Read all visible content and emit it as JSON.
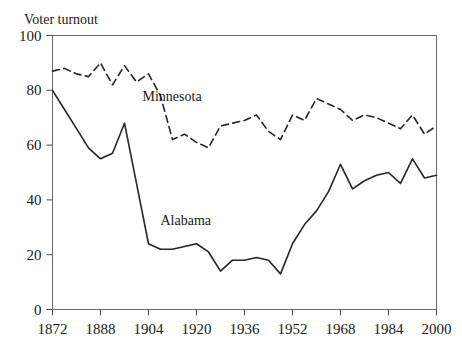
{
  "chart_data": {
    "type": "line",
    "title": "Voter turnout",
    "xlabel": "",
    "ylabel": "Voter turnout",
    "xlim": [
      1872,
      2000
    ],
    "ylim": [
      0,
      100
    ],
    "grid": false,
    "legend_position": "inline-annotation",
    "x_tick_labels": [
      "1872",
      "1888",
      "1904",
      "1920",
      "1936",
      "1952",
      "1968",
      "1984",
      "2000"
    ],
    "x_tick_values": [
      1872,
      1888,
      1904,
      1920,
      1936,
      1952,
      1968,
      1984,
      2000
    ],
    "y_tick_labels": [
      "0",
      "20",
      "40",
      "60",
      "80",
      "100"
    ],
    "y_tick_values": [
      0,
      20,
      40,
      60,
      80,
      100
    ],
    "x": [
      1872,
      1876,
      1880,
      1884,
      1888,
      1892,
      1896,
      1900,
      1904,
      1908,
      1912,
      1916,
      1920,
      1924,
      1928,
      1932,
      1936,
      1940,
      1944,
      1948,
      1952,
      1956,
      1960,
      1964,
      1968,
      1972,
      1976,
      1980,
      1984,
      1988,
      1992,
      1996,
      2000
    ],
    "series": [
      {
        "name": "Minnesota",
        "style": "dashed",
        "color": "#252525",
        "label_x": 1902,
        "label_y": 76,
        "values": [
          87,
          88,
          86,
          85,
          90,
          82,
          89,
          83,
          86,
          78,
          62,
          64,
          61,
          59,
          67,
          68,
          69,
          71,
          65,
          62,
          71,
          69,
          77,
          75,
          73,
          69,
          71,
          70,
          68,
          66,
          71,
          64,
          67
        ]
      },
      {
        "name": "Alabama",
        "style": "solid",
        "color": "#252525",
        "label_x": 1908,
        "label_y": 31,
        "values": [
          80,
          73,
          66,
          59,
          55,
          57,
          68,
          46,
          24,
          22,
          22,
          23,
          24,
          21,
          14,
          18,
          18,
          19,
          18,
          13,
          24,
          31,
          36,
          43,
          53,
          44,
          47,
          49,
          50,
          46,
          55,
          48,
          49
        ]
      }
    ]
  }
}
